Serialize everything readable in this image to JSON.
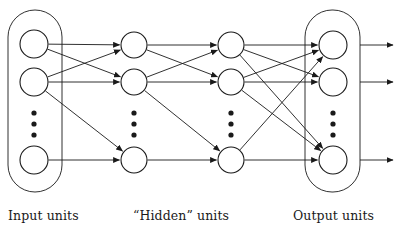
{
  "figure": {
    "type": "neural-network-diagram",
    "background_color": "#ffffff",
    "stroke_color": "#1a1a1a",
    "node_fill_color": "#ffffff"
  },
  "labels": {
    "input": "Input units",
    "hidden": "“Hidden” units",
    "output": "Output units"
  },
  "groups": [
    {
      "id": "input-group",
      "label_key": "input",
      "x": 8,
      "y": 10,
      "width": 54,
      "height": 182,
      "corner_radius": 27,
      "enclosing_box": true
    },
    {
      "id": "output-group",
      "label_key": "output",
      "x": 305,
      "y": 10,
      "width": 55,
      "height": 182,
      "corner_radius": 27,
      "enclosing_box": true
    }
  ],
  "layers": [
    {
      "id": "input",
      "name": "Input units",
      "center_x": 34,
      "node_radius": 14,
      "nodes": [
        {
          "id": "i1",
          "cy": 44
        },
        {
          "id": "i2",
          "cy": 82
        },
        {
          "id": "i3",
          "cy": 160
        }
      ],
      "ellipsis": {
        "cx": 34,
        "dots": [
          113,
          124,
          135
        ],
        "dot_radius": 2.6
      }
    },
    {
      "id": "hidden1",
      "name": "Hidden layer 1",
      "center_x": 134,
      "node_radius": 13,
      "nodes": [
        {
          "id": "h1a",
          "cy": 45
        },
        {
          "id": "h1b",
          "cy": 82
        },
        {
          "id": "h1c",
          "cy": 160
        }
      ],
      "ellipsis": {
        "cx": 134,
        "dots": [
          113,
          124,
          135
        ],
        "dot_radius": 2.6
      }
    },
    {
      "id": "hidden2",
      "name": "Hidden layer 2",
      "center_x": 231,
      "node_radius": 13,
      "nodes": [
        {
          "id": "h2a",
          "cy": 45
        },
        {
          "id": "h2b",
          "cy": 82
        },
        {
          "id": "h2c",
          "cy": 160
        }
      ],
      "ellipsis": {
        "cx": 231,
        "dots": [
          113,
          124,
          135
        ],
        "dot_radius": 2.6
      }
    },
    {
      "id": "output",
      "name": "Output units",
      "center_x": 333,
      "node_radius": 14,
      "nodes": [
        {
          "id": "o1",
          "cy": 45
        },
        {
          "id": "o2",
          "cy": 82
        },
        {
          "id": "o3",
          "cy": 160
        }
      ],
      "ellipsis": {
        "cx": 333,
        "dots": [
          113,
          124,
          135
        ],
        "dot_radius": 2.6
      }
    }
  ],
  "connections": {
    "input_to_hidden1": [
      {
        "from": "i1",
        "to": "h1a"
      },
      {
        "from": "i1",
        "to": "h1b"
      },
      {
        "from": "i2",
        "to": "h1a"
      },
      {
        "from": "i2",
        "to": "h1b"
      },
      {
        "from": "i2",
        "to": "h1c"
      },
      {
        "from": "i3",
        "to": "h1c"
      }
    ],
    "hidden1_to_hidden2": [
      {
        "from": "h1a",
        "to": "h2a"
      },
      {
        "from": "h1a",
        "to": "h2b"
      },
      {
        "from": "h1b",
        "to": "h2a"
      },
      {
        "from": "h1b",
        "to": "h2b"
      },
      {
        "from": "h1b",
        "to": "h2c"
      },
      {
        "from": "h1c",
        "to": "h2c"
      }
    ],
    "hidden2_to_output": [
      {
        "from": "h2a",
        "to": "o1"
      },
      {
        "from": "h2a",
        "to": "o2"
      },
      {
        "from": "h2a",
        "to": "o3"
      },
      {
        "from": "h2b",
        "to": "o1"
      },
      {
        "from": "h2b",
        "to": "o2"
      },
      {
        "from": "h2b",
        "to": "o3"
      },
      {
        "from": "h2c",
        "to": "o1"
      },
      {
        "from": "h2c",
        "to": "o3"
      }
    ]
  },
  "output_arrows": [
    {
      "id": "out-arrow-1",
      "y": 45,
      "x_start": 360,
      "x_end": 393
    },
    {
      "id": "out-arrow-2",
      "y": 82,
      "x_start": 360,
      "x_end": 393
    },
    {
      "id": "out-arrow-3",
      "y": 160,
      "x_start": 360,
      "x_end": 393
    }
  ]
}
